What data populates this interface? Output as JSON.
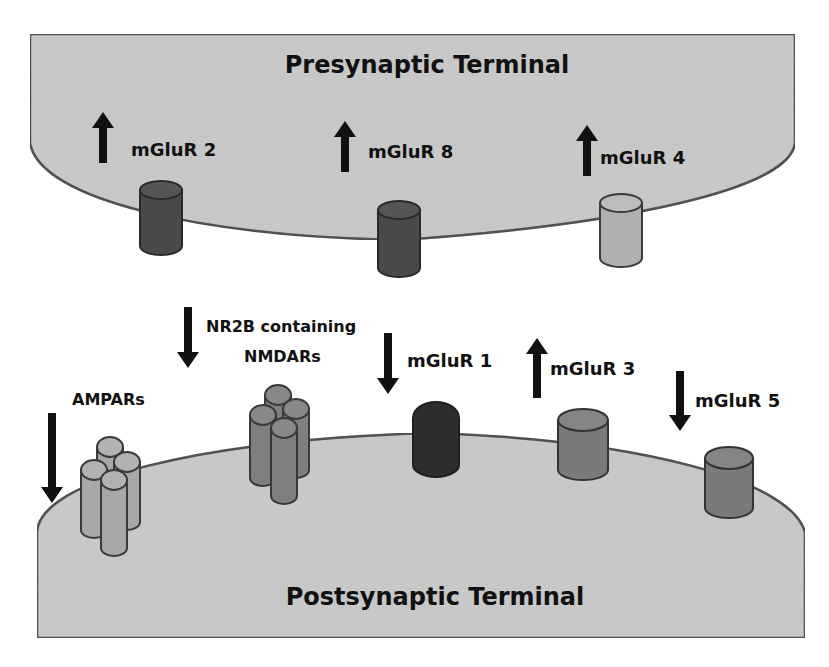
{
  "diagram": {
    "presynaptic": {
      "label": "Presynaptic Terminal",
      "fill": "#c9c9c9",
      "receptors": [
        {
          "name": "mGluR 2",
          "change": "up",
          "color": "#4a4a4a"
        },
        {
          "name": "mGluR 8",
          "change": "up",
          "color": "#4a4a4a"
        },
        {
          "name": "mGluR 4",
          "change": "up",
          "color": "#b0b0b0"
        }
      ]
    },
    "postsynaptic": {
      "label": "Postsynaptic Terminal",
      "fill": "#c9c9c9",
      "receptors": [
        {
          "name": "AMPARs",
          "change": "down",
          "color": "#a8a8a8"
        },
        {
          "name_line1": "NR2B containing",
          "name_line2": "NMDARs",
          "change": "down",
          "color": "#7f7f7f"
        },
        {
          "name": "mGluR 1",
          "change": "down",
          "color": "#2e2e2e"
        },
        {
          "name": "mGluR 3",
          "change": "up",
          "color": "#7a7a7a"
        },
        {
          "name": "mGluR 5",
          "change": "down",
          "color": "#7a7a7a"
        }
      ]
    },
    "icons": {
      "up": "arrow-up-icon",
      "down": "arrow-down-icon"
    },
    "colors": {
      "outline": "#3a3a3a",
      "arrow": "#111111",
      "background": "#ffffff"
    }
  }
}
